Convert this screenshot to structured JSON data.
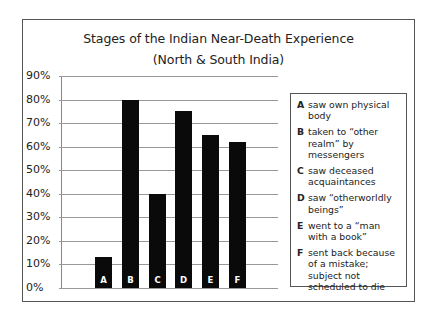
{
  "chart_data": {
    "type": "bar",
    "title": "Stages of the Indian Near-Death Experience",
    "subtitle": "(North & South India)",
    "xlabel": "",
    "ylabel": "",
    "categories": [
      "A",
      "B",
      "C",
      "D",
      "E",
      "F"
    ],
    "values": [
      13,
      80,
      40,
      75,
      65,
      62
    ],
    "ylim": [
      0,
      90
    ],
    "yticks": [
      "0%",
      "10%",
      "20%",
      "30%",
      "40%",
      "50%",
      "60%",
      "70%",
      "80%",
      "90%"
    ],
    "grid": true,
    "legend_position": "right",
    "bar_color": "#0a0a0a",
    "legend": [
      {
        "key": "A",
        "text": "saw own physical body"
      },
      {
        "key": "B",
        "text": "taken to “other realm” by messengers"
      },
      {
        "key": "C",
        "text": "saw deceased acquaintances"
      },
      {
        "key": "D",
        "text": "saw “otherworldly beings”"
      },
      {
        "key": "E",
        "text": "went to a “man with a book”"
      },
      {
        "key": "F",
        "text": "sent back because of a mistake; subject not scheduled to die"
      }
    ]
  }
}
